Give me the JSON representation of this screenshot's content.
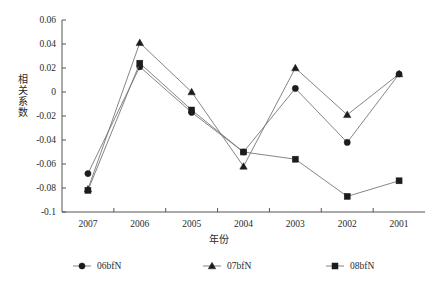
{
  "chart_data": {
    "type": "line",
    "title": "",
    "xlabel": "年份",
    "ylabel": "相关系数",
    "categories": [
      "2007",
      "2006",
      "2005",
      "2004",
      "2003",
      "2002",
      "2001"
    ],
    "ylim": [
      -0.1,
      0.06
    ],
    "ytick_labels": [
      "0.06",
      "0.04",
      "0.02",
      "0",
      "-0.02",
      "-0.04",
      "-0.06",
      "-0.08",
      "-0.1"
    ],
    "ytick_values": [
      0.06,
      0.04,
      0.02,
      0,
      -0.02,
      -0.04,
      -0.06,
      -0.08,
      -0.1
    ],
    "grid": false,
    "legend_position": "bottom",
    "series": [
      {
        "name": "06bfN",
        "marker": "circle",
        "color": "#1c1c1c",
        "values": [
          -0.068,
          0.021,
          -0.017,
          -0.05,
          0.003,
          -0.042,
          0.015
        ]
      },
      {
        "name": "07bfN",
        "marker": "triangle",
        "color": "#1c1c1c",
        "values": [
          -0.081,
          0.041,
          0.0,
          -0.062,
          0.02,
          -0.019,
          0.015
        ]
      },
      {
        "name": "08bfN",
        "marker": "square",
        "color": "#1c1c1c",
        "values": [
          -0.082,
          0.024,
          -0.015,
          -0.05,
          -0.056,
          -0.087,
          -0.074
        ]
      }
    ]
  },
  "legend": {
    "items": [
      {
        "label": "06bfN",
        "marker": "circle"
      },
      {
        "label": "07bfN",
        "marker": "triangle"
      },
      {
        "label": "08bfN",
        "marker": "square"
      }
    ]
  },
  "axes": {
    "y_title": "相关系数",
    "x_title": "年份"
  }
}
